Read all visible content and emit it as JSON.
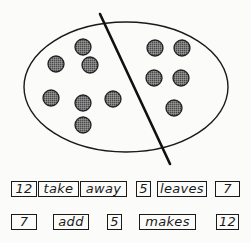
{
  "diagram": {
    "ellipse": {
      "cx": 126,
      "cy": 87,
      "rx": 102,
      "ry": 65
    },
    "divider_line": {
      "x1": 100,
      "y1": 14,
      "x2": 170,
      "y2": 164
    },
    "left_group": {
      "count": 7,
      "dots": [
        [
          83,
          47
        ],
        [
          56,
          64
        ],
        [
          90,
          65
        ],
        [
          51,
          98
        ],
        [
          83,
          103
        ],
        [
          113,
          99
        ],
        [
          83,
          125
        ]
      ]
    },
    "right_group": {
      "count": 5,
      "dots": [
        [
          155,
          48
        ],
        [
          182,
          48
        ],
        [
          154,
          78
        ],
        [
          181,
          78
        ],
        [
          174,
          108
        ]
      ]
    },
    "dot_radius": 8,
    "dot_color": "#6a6a6a",
    "stroke_color": "#1a1a1a"
  },
  "sentences": [
    {
      "words": [
        {
          "text": "12",
          "x": 11,
          "w": 26
        },
        {
          "text": "take",
          "x": 38,
          "w": 41
        },
        {
          "text": "away",
          "x": 80,
          "w": 47
        },
        {
          "text": "5",
          "x": 136,
          "w": 15
        },
        {
          "text": "leaves",
          "x": 157,
          "w": 50
        },
        {
          "text": "7",
          "x": 215,
          "w": 25
        }
      ],
      "y": 181
    },
    {
      "words": [
        {
          "text": "7",
          "x": 11,
          "w": 26
        },
        {
          "text": "add",
          "x": 53,
          "w": 36
        },
        {
          "text": "5",
          "x": 107,
          "w": 15
        },
        {
          "text": "makes",
          "x": 139,
          "w": 57
        },
        {
          "text": "12",
          "x": 216,
          "w": 23
        }
      ],
      "y": 214
    }
  ]
}
